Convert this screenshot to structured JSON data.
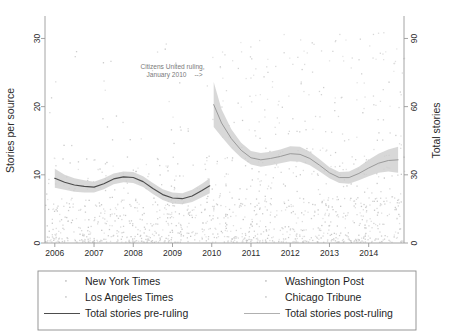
{
  "chart_data": {
    "type": "line",
    "title": "",
    "subtitle": "",
    "xlabel": "",
    "ylabel": "Stories per source",
    "y2label": "Total stories",
    "xlim": [
      2005.75,
      2014.9
    ],
    "ylim": [
      0,
      33
    ],
    "y2lim": [
      0,
      99
    ],
    "grid": false,
    "legend_position": "bottom",
    "xticks": [
      "2006",
      "2007",
      "2008",
      "2009",
      "2010",
      "2011",
      "2012",
      "2013",
      "2014"
    ],
    "xtick_values": [
      2006,
      2007,
      2008,
      2009,
      2010,
      2011,
      2012,
      2013,
      2014
    ],
    "yticks": [
      "0",
      "10",
      "20",
      "30"
    ],
    "ytick_values": [
      0,
      10,
      20,
      30
    ],
    "y2ticks": [
      "0",
      "30",
      "60",
      "90"
    ],
    "y2tick_values": [
      0,
      30,
      60,
      90
    ],
    "annotations": [
      {
        "name": "citizens-united-annotation",
        "text_line1": "Citizens United ruling,",
        "text_line2": "January 2010",
        "arrow": "-->",
        "x": 2009.0,
        "y": 25.5
      }
    ],
    "series": [
      {
        "name": "Total stories pre-ruling",
        "type": "line",
        "color": "#4d4d4d",
        "x": [
          2006.0,
          2006.25,
          2006.5,
          2006.75,
          2007.0,
          2007.25,
          2007.5,
          2007.75,
          2008.0,
          2008.25,
          2008.5,
          2008.75,
          2009.0,
          2009.25,
          2009.5,
          2009.75,
          2009.95
        ],
        "values": [
          9.5,
          8.9,
          8.5,
          8.3,
          8.2,
          8.7,
          9.4,
          9.7,
          9.6,
          9.0,
          8.0,
          7.1,
          6.6,
          6.5,
          6.9,
          7.7,
          8.4
        ],
        "band_lower": [
          8.1,
          7.8,
          7.5,
          7.4,
          7.4,
          7.9,
          8.6,
          8.9,
          8.8,
          8.2,
          7.2,
          6.3,
          5.8,
          5.7,
          6.0,
          6.7,
          7.3
        ],
        "band_upper": [
          10.9,
          10.0,
          9.5,
          9.2,
          9.0,
          9.5,
          10.2,
          10.5,
          10.4,
          9.8,
          8.8,
          7.9,
          7.4,
          7.3,
          7.8,
          8.7,
          9.5
        ]
      },
      {
        "name": "Total stories post-ruling",
        "type": "line",
        "color": "#9a9a9a",
        "x": [
          2010.05,
          2010.25,
          2010.5,
          2010.75,
          2011.0,
          2011.25,
          2011.5,
          2011.75,
          2012.0,
          2012.25,
          2012.5,
          2012.75,
          2013.0,
          2013.25,
          2013.5,
          2013.75,
          2014.0,
          2014.25,
          2014.5,
          2014.75
        ],
        "values": [
          20.3,
          17.6,
          15.3,
          13.6,
          12.5,
          12.2,
          12.4,
          12.7,
          13.1,
          13.0,
          12.4,
          11.4,
          10.3,
          9.6,
          9.6,
          10.2,
          11.0,
          11.7,
          12.1,
          12.2
        ],
        "band_lower": [
          17.0,
          15.6,
          13.9,
          12.5,
          11.5,
          11.2,
          11.4,
          11.7,
          12.0,
          11.9,
          11.4,
          10.5,
          9.5,
          8.8,
          8.7,
          9.2,
          9.8,
          10.3,
          10.5,
          10.3
        ],
        "band_upper": [
          23.6,
          19.6,
          16.7,
          14.7,
          13.5,
          13.2,
          13.4,
          13.7,
          14.2,
          14.1,
          13.4,
          12.3,
          11.1,
          10.4,
          10.5,
          11.2,
          12.2,
          13.1,
          13.7,
          14.1
        ]
      }
    ],
    "scatter_series": [
      {
        "name": "New York Times",
        "marker": "dot",
        "color": "#d2d2d2"
      },
      {
        "name": "Washington Post",
        "marker": "dot",
        "color": "#d2d2d2"
      },
      {
        "name": "Los Angeles Times",
        "marker": "dot",
        "color": "#d8d8d8"
      },
      {
        "name": "Chicago Tribune",
        "marker": "dot",
        "color": "#d8d8d8"
      }
    ]
  },
  "legend": {
    "entries": [
      {
        "label": "New York Times",
        "marker": "dot",
        "color": "#cfcfcf"
      },
      {
        "label": "Washington Post",
        "marker": "dot",
        "color": "#cfcfcf"
      },
      {
        "label": "Los Angeles Times",
        "marker": "dot",
        "color": "#d6d6d6"
      },
      {
        "label": "Chicago Tribune",
        "marker": "dot",
        "color": "#d6d6d6"
      },
      {
        "label": "Total stories pre-ruling",
        "marker": "line",
        "color": "#4d4d4d"
      },
      {
        "label": "Total stories post-ruling",
        "marker": "line",
        "color": "#b0b0b0"
      }
    ]
  },
  "colors": {
    "axis": "#9a9a9a",
    "pre_line": "#4d4d4d",
    "post_line": "#9a9a9a",
    "band": "#cfcfcf",
    "scatter": "#d4d4d4",
    "legend_border": "#8c8c8c",
    "annotation": "#7a7a7a",
    "background": "#ffffff"
  }
}
